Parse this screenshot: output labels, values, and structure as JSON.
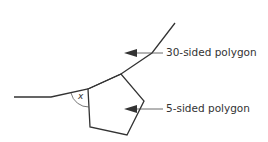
{
  "diagram": {
    "labels": {
      "thirty_sided": "30-sided polygon",
      "five_sided": "5-sided polygon",
      "angle": "x"
    },
    "colors": {
      "stroke": "#333333"
    }
  }
}
